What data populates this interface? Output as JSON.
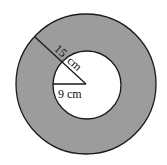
{
  "diagram": {
    "type": "annulus",
    "outer_radius_label": "15 cm",
    "inner_radius_label": "9 cm",
    "label_outer_num": "15",
    "label_outer_unit": "cm",
    "shaded_region": "ring between circles",
    "colors": {
      "ring_fill": "#9a9a9a",
      "inner_fill": "#ffffff",
      "stroke": "#1a1a1a"
    }
  }
}
